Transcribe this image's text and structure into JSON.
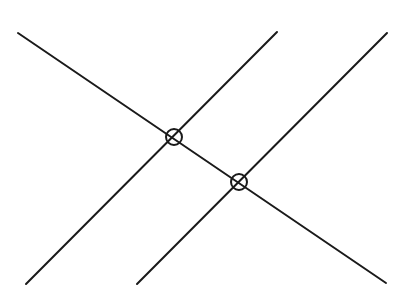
{
  "diagram": {
    "width": 410,
    "height": 303,
    "background": "#ffffff",
    "stroke_color": "#1a1a1a",
    "stroke_width": 2,
    "lines": [
      {
        "name": "transversal-line",
        "x1": 18,
        "y1": 33,
        "x2": 386,
        "y2": 283
      },
      {
        "name": "parallel-line-1",
        "x1": 26,
        "y1": 284,
        "x2": 277,
        "y2": 32
      },
      {
        "name": "parallel-line-2",
        "x1": 137,
        "y1": 284,
        "x2": 387,
        "y2": 33
      }
    ],
    "intersections": [
      {
        "name": "intersection-marker-1",
        "cx": 174,
        "cy": 137,
        "r": 8
      },
      {
        "name": "intersection-marker-2",
        "cx": 239,
        "cy": 182,
        "r": 8
      }
    ]
  }
}
